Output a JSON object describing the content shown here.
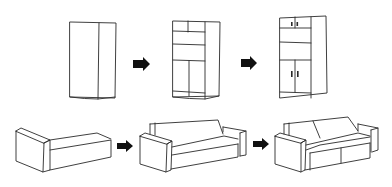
{
  "diagram": {
    "rows": [
      {
        "name": "wardrobe",
        "stages": [
          {
            "label": "wardrobe-basic-box"
          },
          {
            "label": "wardrobe-with-compartments"
          },
          {
            "label": "wardrobe-with-doors-and-handles"
          }
        ]
      },
      {
        "name": "sofa",
        "stages": [
          {
            "label": "sofa-base-with-one-arm"
          },
          {
            "label": "sofa-with-back-and-arms"
          },
          {
            "label": "sofa-with-two-cushions"
          }
        ]
      }
    ],
    "arrow_icon": "right-arrow-icon",
    "colors": {
      "line": "#2a2a2a",
      "arrow": "#111111",
      "background": "#ffffff"
    }
  }
}
